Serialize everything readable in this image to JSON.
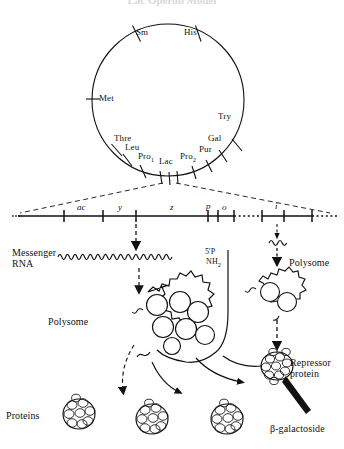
{
  "figure": {
    "title": "Lac Operon Model",
    "type": "biological-diagram"
  },
  "chromosome_map": {
    "name": "circular-chromosome",
    "markers": [
      {
        "label": "Sm",
        "angle_deg": 295
      },
      {
        "label": "His",
        "angle_deg": 245
      },
      {
        "label": "Met",
        "angle_deg": 5
      },
      {
        "label": "Try",
        "angle_deg": 205
      },
      {
        "label": "Thre",
        "angle_deg": 50
      },
      {
        "label": "Leu",
        "angle_deg": 60
      },
      {
        "label": "Pro",
        "sub": "1",
        "angle_deg": 72
      },
      {
        "label": "Lac",
        "angle_deg": 88
      },
      {
        "label": "Pro",
        "sub": "2",
        "angle_deg": 102
      },
      {
        "label": "Pur",
        "angle_deg": 112
      },
      {
        "label": "Gal",
        "angle_deg": 124
      }
    ]
  },
  "operon_map": {
    "name": "linear-operon",
    "loci": [
      "ac",
      "y",
      "z",
      "p",
      "o",
      "i"
    ],
    "labels": {
      "ac": "ac",
      "y": "y",
      "z": "z",
      "p": "p",
      "o": "o",
      "i": "i"
    }
  },
  "mrna": {
    "label_line1": "Messenger",
    "label_line2": "RNA",
    "end_5prime": "5'P",
    "end_amino": "NH",
    "end_amino_sub": "2"
  },
  "structures": {
    "polysome_left": "Polysome",
    "polysome_right": "Polysome",
    "repressor_line1": "Repressor",
    "repressor_line2": "protein",
    "proteins": "Proteins",
    "inducer": "β-galactoside"
  },
  "colors": {
    "ink": "#111111",
    "line": "#000000",
    "paper": "#ffffff",
    "title": "#d8d8d8"
  }
}
